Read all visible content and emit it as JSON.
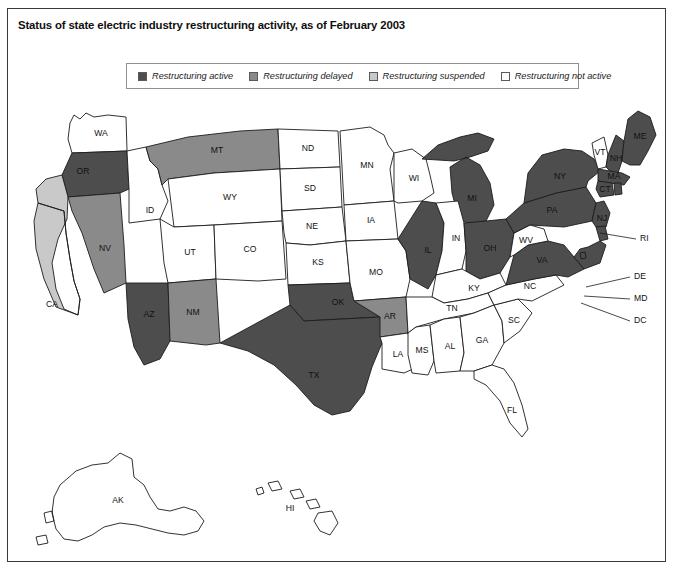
{
  "figure": {
    "title": "Status of state electric industry restructuring activity, as of February 2003"
  },
  "legend": {
    "items": [
      {
        "label": "Restructuring active",
        "status": "active",
        "color": "#4d4d4d"
      },
      {
        "label": "Restructuring delayed",
        "status": "delayed",
        "color": "#8a8a8a"
      },
      {
        "label": "Restructuring suspended",
        "status": "suspended",
        "color": "#c9c9c9"
      },
      {
        "label": "Restructuring not active",
        "status": "not_active",
        "color": "#ffffff"
      }
    ]
  },
  "colors": {
    "active": "#4d4d4d",
    "delayed": "#8a8a8a",
    "suspended": "#c9c9c9",
    "not_active": "#ffffff",
    "border": "#1c1c1c",
    "frame": "#3a3a3a",
    "text": "#111111"
  },
  "chart_data": {
    "type": "map",
    "title": "Status of state electric industry restructuring activity, as of February 2003",
    "region": "United States",
    "categories": [
      "active",
      "delayed",
      "suspended",
      "not_active"
    ],
    "category_labels": {
      "active": "Restructuring active",
      "delayed": "Restructuring delayed",
      "suspended": "Restructuring suspended",
      "not_active": "Restructuring not active"
    },
    "counts": {
      "active": 18,
      "delayed": 5,
      "suspended": 1,
      "not_active": 27
    },
    "states": [
      {
        "code": "WA",
        "status": "not_active"
      },
      {
        "code": "OR",
        "status": "active"
      },
      {
        "code": "CA",
        "status": "suspended"
      },
      {
        "code": "NV",
        "status": "delayed"
      },
      {
        "code": "ID",
        "status": "not_active"
      },
      {
        "code": "MT",
        "status": "delayed"
      },
      {
        "code": "WY",
        "status": "not_active"
      },
      {
        "code": "UT",
        "status": "not_active"
      },
      {
        "code": "AZ",
        "status": "active"
      },
      {
        "code": "NM",
        "status": "delayed"
      },
      {
        "code": "CO",
        "status": "not_active"
      },
      {
        "code": "ND",
        "status": "not_active"
      },
      {
        "code": "SD",
        "status": "not_active"
      },
      {
        "code": "NE",
        "status": "not_active"
      },
      {
        "code": "KS",
        "status": "not_active"
      },
      {
        "code": "OK",
        "status": "active"
      },
      {
        "code": "TX",
        "status": "active"
      },
      {
        "code": "MN",
        "status": "not_active"
      },
      {
        "code": "IA",
        "status": "not_active"
      },
      {
        "code": "MO",
        "status": "not_active"
      },
      {
        "code": "AR",
        "status": "delayed"
      },
      {
        "code": "LA",
        "status": "not_active"
      },
      {
        "code": "WI",
        "status": "not_active"
      },
      {
        "code": "IL",
        "status": "active"
      },
      {
        "code": "MI",
        "status": "active"
      },
      {
        "code": "IN",
        "status": "not_active"
      },
      {
        "code": "OH",
        "status": "active"
      },
      {
        "code": "KY",
        "status": "not_active"
      },
      {
        "code": "TN",
        "status": "not_active"
      },
      {
        "code": "MS",
        "status": "not_active"
      },
      {
        "code": "AL",
        "status": "not_active"
      },
      {
        "code": "GA",
        "status": "not_active"
      },
      {
        "code": "FL",
        "status": "not_active"
      },
      {
        "code": "SC",
        "status": "not_active"
      },
      {
        "code": "NC",
        "status": "not_active"
      },
      {
        "code": "VA",
        "status": "active"
      },
      {
        "code": "WV",
        "status": "not_active"
      },
      {
        "code": "PA",
        "status": "active"
      },
      {
        "code": "NY",
        "status": "active"
      },
      {
        "code": "VT",
        "status": "not_active"
      },
      {
        "code": "NH",
        "status": "active"
      },
      {
        "code": "ME",
        "status": "active"
      },
      {
        "code": "MA",
        "status": "active"
      },
      {
        "code": "CT",
        "status": "active"
      },
      {
        "code": "RI",
        "status": "active"
      },
      {
        "code": "NJ",
        "status": "active"
      },
      {
        "code": "DE",
        "status": "active"
      },
      {
        "code": "MD",
        "status": "active"
      },
      {
        "code": "DC",
        "status": "active"
      },
      {
        "code": "AK",
        "status": "not_active"
      },
      {
        "code": "HI",
        "status": "not_active"
      }
    ],
    "callout_labels": [
      "RI",
      "DE",
      "MD",
      "DC"
    ]
  }
}
